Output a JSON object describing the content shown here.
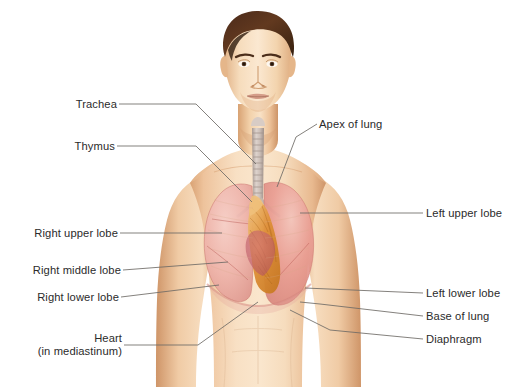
{
  "figure": {
    "background_color": "#ffffff",
    "width": 516,
    "height": 387
  },
  "palette": {
    "text": "#2b2b2b",
    "leader_line": "#6e6a66",
    "skin_light": "#f6d9b9",
    "skin_mid": "#edc49c",
    "skin_shadow": "#d9a274",
    "skin_deep": "#c08a5e",
    "hair_dark": "#3d2317",
    "hair_mid": "#5c3520",
    "lung_right": "#efb3ac",
    "lung_left": "#e8998f",
    "lung_edge": "#c9736c",
    "trachea": "#cfc3bd",
    "trachea_band": "#b3a49c",
    "mediastinum": "#dd8f3c",
    "mediastinum_light": "#f0c07a",
    "heart": "#c9606a",
    "lip": "#d39a86"
  },
  "labels": {
    "left": [
      {
        "id": "trachea",
        "text": "Trachea",
        "text2": null
      },
      {
        "id": "thymus",
        "text": "Thymus",
        "text2": null
      },
      {
        "id": "right-upper-lobe",
        "text": "Right upper lobe",
        "text2": null
      },
      {
        "id": "right-middle-lobe",
        "text": "Right middle lobe",
        "text2": null
      },
      {
        "id": "right-lower-lobe",
        "text": "Right lower lobe",
        "text2": null
      },
      {
        "id": "heart",
        "text": "Heart",
        "text2": "(in mediastinum)"
      }
    ],
    "right": [
      {
        "id": "apex-of-lung",
        "text": "Apex of lung",
        "text2": null
      },
      {
        "id": "left-upper-lobe",
        "text": "Left upper lobe",
        "text2": null
      },
      {
        "id": "left-lower-lobe",
        "text": "Left lower lobe",
        "text2": null
      },
      {
        "id": "base-of-lung",
        "text": "Base of lung",
        "text2": null
      },
      {
        "id": "diaphragm",
        "text": "Diaphragm",
        "text2": null
      }
    ]
  }
}
